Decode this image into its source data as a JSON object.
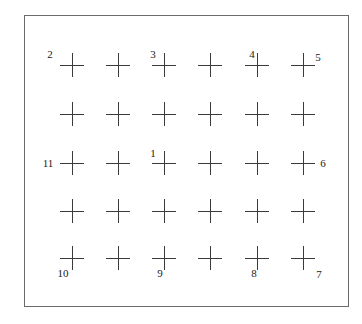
{
  "diagram": {
    "type": "calibration-grid",
    "frame": {
      "left": 24,
      "top": 15,
      "right": 348,
      "bottom": 306,
      "stroke": "#6a6a6a"
    },
    "cross_color": "#3a3a3a",
    "grid": {
      "columns_x": [
        72,
        118,
        164,
        210,
        257,
        303
      ],
      "rows_y": [
        65,
        114,
        163,
        211,
        258
      ],
      "cross_size": 24
    },
    "labels": [
      {
        "text": "1",
        "x": 153,
        "y": 153
      },
      {
        "text": "2",
        "x": 50,
        "y": 54
      },
      {
        "text": "3",
        "x": 153,
        "y": 54
      },
      {
        "text": "4",
        "x": 252,
        "y": 54
      },
      {
        "text": "5",
        "x": 318,
        "y": 57
      },
      {
        "text": "6",
        "x": 323,
        "y": 163
      },
      {
        "text": "7",
        "x": 319,
        "y": 274
      },
      {
        "text": "8",
        "x": 254,
        "y": 273
      },
      {
        "text": "9",
        "x": 160,
        "y": 273
      },
      {
        "text": "10",
        "x": 63,
        "y": 273
      },
      {
        "text": "11",
        "x": 48,
        "y": 163
      }
    ]
  }
}
